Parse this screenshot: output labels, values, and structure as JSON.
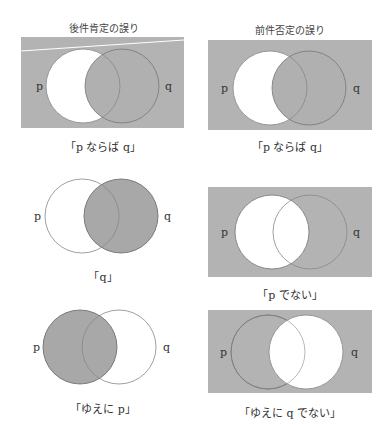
{
  "columns": [
    {
      "title": "後件肯定の誤り"
    },
    {
      "title": "前件否定の誤り"
    }
  ],
  "labels": {
    "p": "p",
    "q": "q"
  },
  "colors": {
    "background": "#ffffff",
    "shade": "#b3b3b3",
    "dark_shade": "#a6a6a6",
    "stroke": "#666666",
    "light_stroke": "#999999"
  },
  "diagrams": [
    {
      "id": "left-1",
      "caption": "「p ならば q」",
      "universe_shaded": true,
      "shaded": "outside p, plus q",
      "description": "p minus q white; everything else shaded"
    },
    {
      "id": "right-1",
      "caption": "「p ならば q」",
      "universe_shaded": true,
      "shaded": "outside p, plus q",
      "description": "p minus q white; everything else shaded"
    },
    {
      "id": "left-2",
      "caption": "「q」",
      "universe_shaded": false,
      "shaded": "q",
      "description": "q shaded"
    },
    {
      "id": "right-2",
      "caption": "「p でない」",
      "universe_shaded": true,
      "shaded": "not p",
      "description": "p white; rest shaded"
    },
    {
      "id": "left-3",
      "caption": "「ゆえに p」",
      "universe_shaded": false,
      "shaded": "p",
      "description": "p shaded"
    },
    {
      "id": "right-3",
      "caption": "「ゆえに q でない」",
      "universe_shaded": true,
      "shaded": "not q",
      "description": "q white; rest shaded"
    }
  ]
}
